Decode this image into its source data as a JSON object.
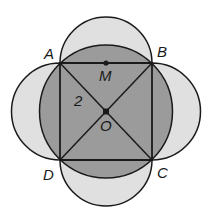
{
  "diagram": {
    "type": "geometry",
    "colors": {
      "semicircle_fill": "#e0e0e0",
      "circle_fill": "#9b9b9b",
      "stroke": "#1a1a1a",
      "background": "#ffffff"
    },
    "points": {
      "A": {
        "label": "A",
        "x": 60,
        "y": 63
      },
      "B": {
        "label": "B",
        "x": 152,
        "y": 63
      },
      "C": {
        "label": "C",
        "x": 152,
        "y": 160
      },
      "D": {
        "label": "D",
        "x": 60,
        "y": 160
      },
      "M": {
        "label": "M",
        "x": 106,
        "y": 63
      },
      "O": {
        "label": "O",
        "x": 106,
        "y": 112
      }
    },
    "segment_labels": {
      "AO": "2"
    },
    "labels": {
      "A": "A",
      "B": "B",
      "C": "C",
      "D": "D",
      "M": "M",
      "O": "O",
      "length_AO": "2"
    }
  }
}
